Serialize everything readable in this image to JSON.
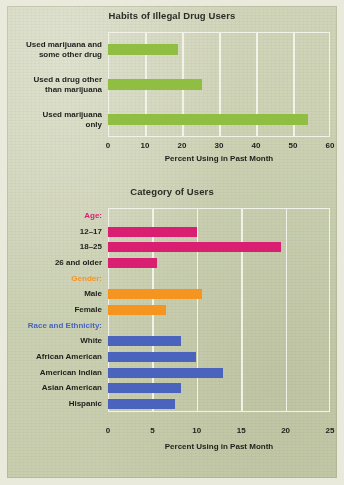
{
  "figure": {
    "background_color": "#cdd2b5",
    "gridline_color": "#f2f3e8"
  },
  "chart_data": [
    {
      "type": "bar",
      "orientation": "horizontal",
      "title": "Habits of Illegal Drug Users",
      "xlabel": "Percent Using in Past Month",
      "ylabel": "",
      "xlim": [
        0,
        60
      ],
      "xticks": [
        "0",
        "10",
        "20",
        "30",
        "40",
        "50",
        "60"
      ],
      "xtick_values": [
        0,
        10,
        20,
        30,
        40,
        50,
        60
      ],
      "grid": true,
      "legend": "none",
      "bar_color": "#8fbe42",
      "categories": [
        "Used marijuana and some other drug",
        "Used a drug other than marijuana",
        "Used marijuana only"
      ],
      "category_lines": [
        [
          "Used marijuana and",
          "some other drug"
        ],
        [
          "Used a drug other",
          "than marijuana"
        ],
        [
          "Used marijuana",
          "only"
        ]
      ],
      "values": [
        19,
        25.5,
        54
      ]
    },
    {
      "type": "bar",
      "orientation": "horizontal",
      "title": "Category of Users",
      "xlabel": "Percent Using in Past Month",
      "ylabel": "",
      "xlim": [
        0,
        25
      ],
      "xticks": [
        "0",
        "5",
        "10",
        "15",
        "20",
        "25"
      ],
      "xtick_values": [
        0,
        5,
        10,
        15,
        20,
        25
      ],
      "grid": true,
      "legend": "none",
      "groups": [
        {
          "name": "Age:",
          "color": "#d81f72",
          "categories": [
            "12–17",
            "18–25",
            "26 and older"
          ],
          "values": [
            10.0,
            19.5,
            5.5
          ]
        },
        {
          "name": "Gender:",
          "color": "#f5941f",
          "categories": [
            "Male",
            "Female"
          ],
          "values": [
            10.6,
            6.5
          ]
        },
        {
          "name": "Race and Ethnicity:",
          "color": "#4a64be",
          "categories": [
            "White",
            "African American",
            "American Indian",
            "Asian American",
            "Hispanic"
          ],
          "values": [
            8.2,
            9.9,
            12.9,
            8.2,
            7.6
          ]
        }
      ]
    }
  ]
}
